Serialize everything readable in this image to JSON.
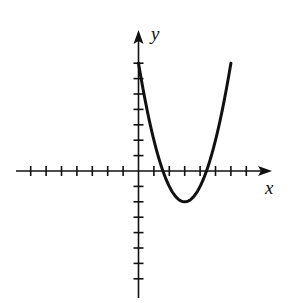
{
  "figure": {
    "type": "function-graph"
  },
  "axes": {
    "x_label": "x",
    "y_label": "y",
    "x_ticks": [
      -7,
      -6,
      -5,
      -4,
      -3,
      -2,
      -1,
      1,
      2,
      3,
      4,
      5,
      6,
      7
    ],
    "y_ticks": [
      -7,
      -6,
      -5,
      -4,
      -3,
      -2,
      -1,
      1,
      2,
      3,
      4,
      5,
      6,
      7
    ],
    "x_range": [
      -8,
      8.5
    ],
    "y_range": [
      -8,
      9
    ],
    "tick_labels_shown": false,
    "arrows": [
      "positive-x",
      "positive-y"
    ]
  },
  "chart_data": {
    "type": "line",
    "title": "",
    "xlabel": "x",
    "ylabel": "y",
    "grid": false,
    "series": [
      {
        "name": "parabola",
        "equation": "y = x^2 - 6x + 7",
        "x": [
          0,
          0.5,
          1,
          1.5,
          2,
          2.5,
          3,
          3.5,
          4,
          4.5,
          5,
          5.5,
          6
        ],
        "values": [
          7,
          4.25,
          2,
          0.25,
          -1,
          -1.75,
          -2,
          -1.75,
          -1,
          0.25,
          2,
          4.25,
          7
        ]
      }
    ],
    "features": {
      "vertex": [
        3,
        -2
      ],
      "x_intercepts": [
        1.59,
        4.41
      ],
      "y_intercept": 7
    },
    "xlim": [
      -8,
      8.5
    ],
    "ylim": [
      -8,
      9
    ]
  },
  "style": {
    "stroke_color": "#111111",
    "background": "#ffffff",
    "origin_px": [
      138.5,
      171
    ],
    "unit_px": 15.4
  }
}
